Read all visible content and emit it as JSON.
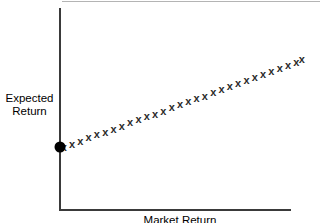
{
  "chart_data": {
    "type": "scatter",
    "title": "",
    "xlabel": "Market Return",
    "ylabel": "Expected\nReturn",
    "grid": false,
    "legend": null,
    "axis_style": "L-shaped open axes, no tick marks, no tick labels",
    "xlim": [
      0,
      260
    ],
    "ylim": [
      0,
      200
    ],
    "annotations": [
      {
        "name": "intercept-dot",
        "shape": "filled-circle",
        "x": 0,
        "y": 66,
        "color": "#000000",
        "note": "risk-free / intercept point on the vertical axis"
      }
    ],
    "series": [
      {
        "name": "observations",
        "marker": "x",
        "color": "#2b2b2b",
        "x": [
          4,
          13,
          22,
          31,
          40,
          49,
          58,
          67,
          76,
          85,
          94,
          103,
          112,
          121,
          130,
          139,
          148,
          157,
          166,
          175,
          184,
          193,
          202,
          211,
          220,
          229,
          238,
          247,
          256,
          262
        ],
        "y": [
          66,
          69,
          72,
          76,
          79,
          82,
          85,
          88,
          92,
          95,
          98,
          101,
          104,
          108,
          111,
          114,
          117,
          120,
          124,
          127,
          130,
          133,
          136,
          140,
          143,
          146,
          149,
          152,
          156,
          159
        ]
      }
    ]
  },
  "labels": {
    "y_axis": "Expected\nReturn",
    "x_axis": "Market Return"
  },
  "colors": {
    "axis": "#3a3a3a",
    "marker": "#2b2b2b",
    "dot": "#000000",
    "top_rule": "#b4b4b4",
    "background": "#ffffff"
  }
}
